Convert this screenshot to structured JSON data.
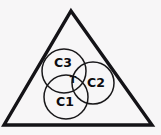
{
  "figure": {
    "kind": "venn-in-triangle-diagram",
    "width": 161,
    "height": 135,
    "background_color": "#f7f6f7"
  },
  "triangle": {
    "name": "outer-triangle",
    "stroke_color": "#141317",
    "stroke_width": 3.4,
    "apex": {
      "x": 71,
      "y": 11
    },
    "bottom_left": {
      "x": 4,
      "y": 125
    },
    "bottom_right": {
      "x": 152,
      "y": 125
    }
  },
  "circles": [
    {
      "id": "C3",
      "label": "C3",
      "cx": 64,
      "cy": 71,
      "r": 22,
      "label_x": 63,
      "label_y": 63,
      "stroke_color": "#19181a"
    },
    {
      "id": "C2",
      "label": "C2",
      "cx": 93,
      "cy": 83,
      "r": 21,
      "label_x": 96,
      "label_y": 83,
      "stroke_color": "#19181a"
    },
    {
      "id": "C1",
      "label": "C1",
      "cx": 66,
      "cy": 97,
      "r": 22,
      "label_x": 65,
      "label_y": 102,
      "stroke_color": "#19181a"
    }
  ],
  "intersection": {
    "id": "T",
    "label": "T",
    "label_x": 73,
    "label_y": 80,
    "description": "central triple-overlap region"
  }
}
